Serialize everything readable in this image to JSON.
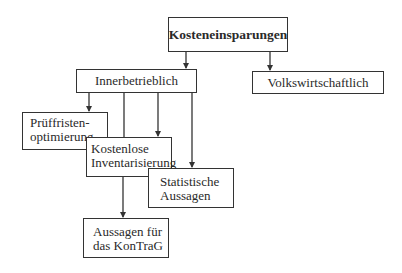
{
  "diagram": {
    "title": "Kosteneinsparungen",
    "nodes": [
      {
        "id": "root",
        "label": "Kosteneinsparungen",
        "bold": true
      },
      {
        "id": "inner",
        "label": "Innerbetrieblich"
      },
      {
        "id": "volk",
        "label": "Volkswirtschaftlich"
      },
      {
        "id": "pruef",
        "line1": "Prüffristen-",
        "line2": "optimierung"
      },
      {
        "id": "kosten",
        "line1": "Kostenlose",
        "line2": "Inventarisierung"
      },
      {
        "id": "stat",
        "line1": "Statistische",
        "line2": "Aussagen"
      },
      {
        "id": "kontrag",
        "line1": "Aussagen für",
        "line2": "das KonTraG"
      }
    ],
    "edges": [
      {
        "from": "root",
        "to": "inner"
      },
      {
        "from": "root",
        "to": "volk"
      },
      {
        "from": "inner",
        "to": "pruef"
      },
      {
        "from": "inner",
        "to": "kosten"
      },
      {
        "from": "inner",
        "to": "stat"
      },
      {
        "from": "inner",
        "to": "kontrag",
        "via": "kosten"
      }
    ],
    "colors": {
      "line": "#333333",
      "text": "#2a2a2a",
      "background": "#ffffff"
    }
  }
}
